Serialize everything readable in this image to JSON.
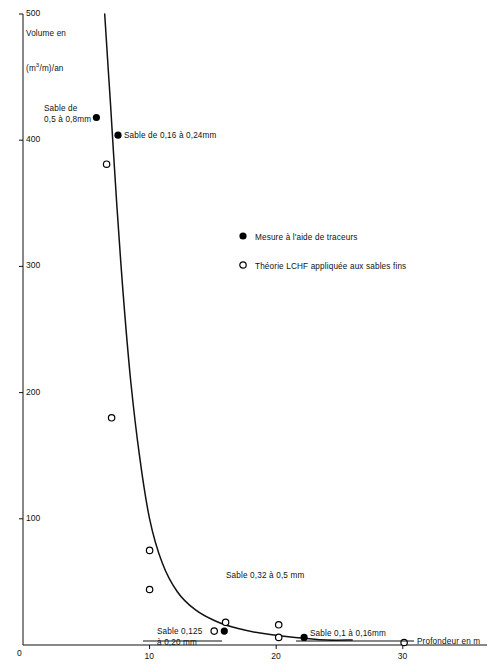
{
  "chart_data": {
    "type": "scatter",
    "title": "",
    "xlabel": "Profondeur en m",
    "ylabel_line1": "Volume en",
    "ylabel_line2_pre": "(m",
    "ylabel_line2_sup": "3",
    "ylabel_line2_post": "/m)/an",
    "xlim": [
      0,
      32
    ],
    "ylim": [
      0,
      500
    ],
    "xticks": [
      0,
      10,
      20,
      30
    ],
    "xticklabels": [
      "0",
      "10",
      "20",
      "30"
    ],
    "yticks": [
      0,
      100,
      200,
      300,
      400,
      500
    ],
    "yticklabels": [
      "0",
      "100",
      "200",
      "300",
      "400",
      "500"
    ],
    "grid": false,
    "legend_position": "center-right",
    "series": [
      {
        "name": "Mesure à l'aide de traceurs",
        "marker": "filled-circle",
        "color": "#000000",
        "points": [
          {
            "x": 5.8,
            "y": 418
          },
          {
            "x": 7.5,
            "y": 404
          },
          {
            "x": 15.9,
            "y": 11
          },
          {
            "x": 22.2,
            "y": 6
          }
        ]
      },
      {
        "name": "Théorie LCHF appliquée aux sables fins",
        "marker": "open-circle",
        "color": "#000000",
        "points": [
          {
            "x": 6.6,
            "y": 381
          },
          {
            "x": 7.0,
            "y": 180
          },
          {
            "x": 10.0,
            "y": 75
          },
          {
            "x": 10.0,
            "y": 44
          },
          {
            "x": 16.0,
            "y": 18
          },
          {
            "x": 15.1,
            "y": 11
          },
          {
            "x": 20.2,
            "y": 16
          },
          {
            "x": 20.2,
            "y": 6
          },
          {
            "x": 30.1,
            "y": 2
          }
        ]
      }
    ],
    "curve": {
      "name": "courbe de tendance",
      "points": [
        {
          "x": 6.45,
          "y": 500
        },
        {
          "x": 6.9,
          "y": 430
        },
        {
          "x": 7.4,
          "y": 350
        },
        {
          "x": 7.9,
          "y": 280
        },
        {
          "x": 8.5,
          "y": 210
        },
        {
          "x": 9.2,
          "y": 150
        },
        {
          "x": 10.0,
          "y": 100
        },
        {
          "x": 11.0,
          "y": 65
        },
        {
          "x": 12.2,
          "y": 42
        },
        {
          "x": 13.6,
          "y": 28
        },
        {
          "x": 15.2,
          "y": 19
        },
        {
          "x": 17.0,
          "y": 13
        },
        {
          "x": 19.0,
          "y": 9
        },
        {
          "x": 21.5,
          "y": 6
        },
        {
          "x": 24.0,
          "y": 4
        },
        {
          "x": 26.0,
          "y": 4
        }
      ]
    },
    "annotations": [
      {
        "id": "sable-05-08",
        "text_line1": "Sable de",
        "text_line2": "0,5 à 0,8mm",
        "x_px": 44,
        "y_px": 104
      },
      {
        "id": "sable-016-024",
        "text_line1": "Sable de 0,16 à 0,24mm",
        "text_line2": "",
        "x_px": 124,
        "y_px": 131
      },
      {
        "id": "sable-032-05",
        "text_line1": "Sable 0,32 à 0,5 mm",
        "text_line2": "",
        "x_px": 226,
        "y_px": 571
      },
      {
        "id": "sable-0125-020",
        "text_line1": "Sable 0,125",
        "text_line2": "à 0,20 mm",
        "x_px": 157,
        "y_px": 627
      },
      {
        "id": "sable-01-016",
        "text_line1": "Sable 0,1 à 0,16mm",
        "text_line2": "",
        "x_px": 310,
        "y_px": 629
      }
    ],
    "legend_entries": [
      {
        "marker": "filled-circle",
        "label": "Mesure à l'aide de traceurs"
      },
      {
        "marker": "open-circle",
        "label": "Théorie LCHF appliquée aux sables fins"
      }
    ]
  }
}
